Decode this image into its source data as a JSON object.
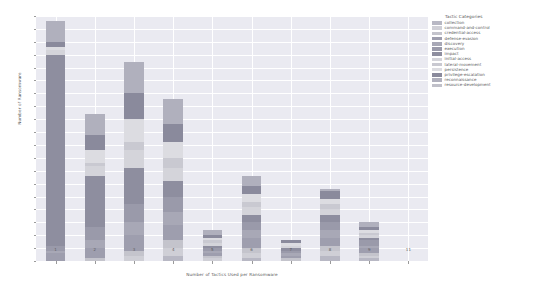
{
  "chart_data": {
    "type": "bar",
    "stacked": true,
    "title": "",
    "xlabel": "Number of Tactics Used per Ransomware",
    "ylabel": "Number of Ransomware",
    "categories": [
      "1",
      "2",
      "3",
      "4",
      "5",
      "6",
      "7",
      "8",
      "9",
      "11"
    ],
    "ylim": [
      0,
      95
    ],
    "ytick_step": 5,
    "yticks": [
      "0",
      "5",
      "10",
      "15",
      "20",
      "25",
      "30",
      "35",
      "40",
      "45",
      "50",
      "55",
      "60",
      "65",
      "70",
      "75",
      "80",
      "85",
      "90",
      "95"
    ],
    "grid": true,
    "legend_position": "right",
    "legend_title": "Tactic Categories",
    "series": [
      {
        "name": "collection",
        "color": "#b8b8c4",
        "values": [
          0,
          0,
          0,
          2,
          0,
          1,
          0,
          2,
          1,
          0
        ]
      },
      {
        "name": "command-and-control",
        "color": "#cfcfd6",
        "values": [
          0,
          0,
          2,
          3,
          1,
          2,
          0,
          2,
          1,
          0
        ]
      },
      {
        "name": "credential-access",
        "color": "#c4c4cc",
        "values": [
          0,
          1,
          2,
          3,
          1,
          2,
          1,
          2,
          1,
          0
        ]
      },
      {
        "name": "defense-evasion",
        "color": "#9e9eae",
        "values": [
          3,
          4,
          6,
          6,
          1,
          4,
          1,
          3,
          2,
          0
        ]
      },
      {
        "name": "discovery",
        "color": "#a8a8b6",
        "values": [
          1,
          3,
          5,
          5,
          1,
          3,
          1,
          3,
          1,
          0
        ]
      },
      {
        "name": "execution",
        "color": "#9a9aaa",
        "values": [
          2,
          5,
          7,
          6,
          1,
          3,
          1,
          3,
          2,
          0
        ]
      },
      {
        "name": "impact",
        "color": "#8e8e9f",
        "values": [
          74,
          20,
          14,
          6,
          1,
          3,
          1,
          3,
          1,
          0
        ]
      },
      {
        "name": "initial-access",
        "color": "#d4d4da",
        "values": [
          2,
          4,
          7,
          5,
          1,
          3,
          1,
          2,
          1,
          0
        ]
      },
      {
        "name": "lateral-movement",
        "color": "#c9c9d1",
        "values": [
          0,
          1,
          3,
          4,
          1,
          2,
          0,
          2,
          1,
          0
        ]
      },
      {
        "name": "persistence",
        "color": "#dcdce1",
        "values": [
          1,
          5,
          9,
          6,
          1,
          3,
          1,
          2,
          1,
          0
        ]
      },
      {
        "name": "privilege-escalation",
        "color": "#8a8a9c",
        "values": [
          2,
          6,
          10,
          7,
          1,
          3,
          1,
          3,
          1,
          0
        ]
      },
      {
        "name": "reconnaissance",
        "color": "#b0b0bd",
        "values": [
          8,
          8,
          12,
          10,
          2,
          4,
          0,
          1,
          2,
          0
        ]
      },
      {
        "name": "resource-development",
        "color": "#c0c0c9",
        "values": [
          0,
          0,
          0,
          0,
          0,
          0,
          0,
          0,
          0,
          0
        ]
      }
    ],
    "bar_totals": [
      93,
      57,
      77,
      63,
      11,
      30,
      8,
      28,
      14,
      0
    ]
  }
}
